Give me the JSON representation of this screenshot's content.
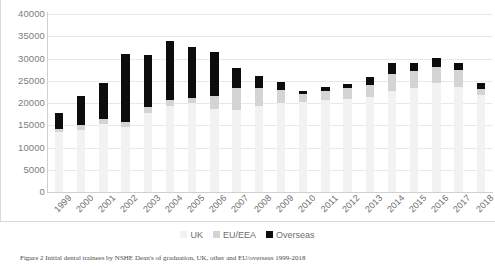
{
  "chart_data": {
    "type": "bar",
    "stacked": true,
    "title": "",
    "xlabel": "",
    "ylabel": "",
    "ylim": [
      0,
      40000
    ],
    "ytick_step": 5000,
    "yticks": [
      "40000",
      "35000",
      "30000",
      "25000",
      "20000",
      "15000",
      "10000",
      "5000",
      "0"
    ],
    "grid": true,
    "legend_position": "bottom",
    "categories": [
      "1999",
      "2000",
      "2001",
      "2002",
      "2003",
      "2004",
      "2005",
      "2006",
      "2007",
      "2008",
      "2009",
      "2010",
      "2011",
      "2012",
      "2013",
      "2014",
      "2015",
      "2016",
      "2017",
      "2018"
    ],
    "series": [
      {
        "name": "UK",
        "color": "#f2f2f2",
        "values": [
          13400,
          14000,
          15200,
          14500,
          17700,
          19300,
          19900,
          18700,
          18500,
          19300,
          19900,
          20200,
          20600,
          20900,
          21400,
          22600,
          23400,
          24400,
          23600,
          21700
        ]
      },
      {
        "name": "EU/EEA",
        "color": "#d4d4d4",
        "values": [
          800,
          1100,
          1300,
          1300,
          1300,
          1300,
          1300,
          2900,
          4900,
          4100,
          3000,
          1900,
          2000,
          2400,
          2700,
          3900,
          3800,
          3800,
          3800,
          1400
        ]
      },
      {
        "name": "Overseas",
        "color": "#0d0d0d",
        "values": [
          3600,
          6400,
          8000,
          15200,
          11800,
          13400,
          11500,
          9800,
          4400,
          2600,
          1800,
          600,
          900,
          900,
          1700,
          2600,
          1800,
          2000,
          1700,
          1300
        ]
      }
    ],
    "totals": [
      17800,
      21500,
      24500,
      31000,
      30800,
      34000,
      32700,
      31400,
      27800,
      26000,
      24700,
      22700,
      23500,
      24200,
      25800,
      29100,
      29000,
      30200,
      29100,
      24400
    ]
  },
  "legend": {
    "items": [
      {
        "label": "UK",
        "color": "#f2f2f2"
      },
      {
        "label": "EU/EEA",
        "color": "#d4d4d4"
      },
      {
        "label": "Overseas",
        "color": "#0d0d0d"
      }
    ]
  },
  "caption": {
    "text": "Figure 2 Initial dental trainees by NSHE Dean's of graduation, UK, other and EU/overseas 1999-2018"
  }
}
